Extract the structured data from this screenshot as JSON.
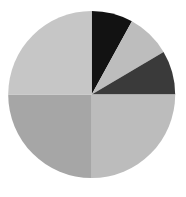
{
  "chart_data": {
    "type": "pie",
    "title": "",
    "start": "12 o'clock",
    "direction": "clockwise",
    "legend": "none",
    "slices": [
      {
        "label": "",
        "value": 8,
        "color": "#121212"
      },
      {
        "label": "",
        "value": 8.5,
        "color": "#bdbdbd"
      },
      {
        "label": "",
        "value": 8.5,
        "color": "#3a3a3a"
      },
      {
        "label": "",
        "value": 25,
        "color": "#bcbcbc"
      },
      {
        "label": "",
        "value": 25,
        "color": "#a6a6a6"
      },
      {
        "label": "",
        "value": 25,
        "color": "#c6c6c6"
      }
    ]
  }
}
